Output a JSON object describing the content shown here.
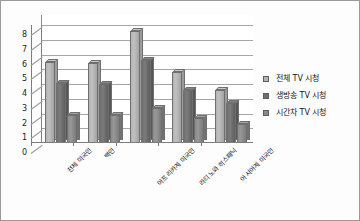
{
  "chart_data": {
    "type": "bar",
    "title": "",
    "xlabel": "",
    "ylabel": "",
    "ylim": [
      0,
      8
    ],
    "ytick_labels": [
      "0",
      "1",
      "2",
      "3",
      "4",
      "5",
      "6",
      "7",
      "8"
    ],
    "grid": true,
    "legend_position": "right",
    "categories": [
      "전체 미국인",
      "백인",
      "아프리카계 미국인",
      "라티노와 히스패닉",
      "아시아계 미국인"
    ],
    "series": [
      {
        "name": "전체 TV 시청",
        "color": "#b3b3b3",
        "values": [
          5.5,
          5.4,
          7.6,
          4.8,
          3.6
        ]
      },
      {
        "name": "생방송 TV 시청",
        "color": "#6e6e6e",
        "values": [
          4.1,
          4.0,
          5.6,
          3.6,
          2.7
        ]
      },
      {
        "name": "시간차 TV 시청",
        "color": "#8a8a8a",
        "values": [
          1.9,
          1.9,
          2.4,
          1.7,
          1.3
        ]
      }
    ]
  },
  "legend": {
    "items": [
      {
        "label": "전체 TV 시청"
      },
      {
        "label": "생방송 TV 시청"
      },
      {
        "label": "시간차 TV 시청"
      }
    ]
  },
  "colors": {
    "series_1": "#b3b3b3",
    "series_2": "#6e6e6e",
    "series_3": "#8a8a8a",
    "axis": "#7d7d7d",
    "grid": "#a6a6a6",
    "border": "#9a9a9a",
    "text": "#151515"
  }
}
